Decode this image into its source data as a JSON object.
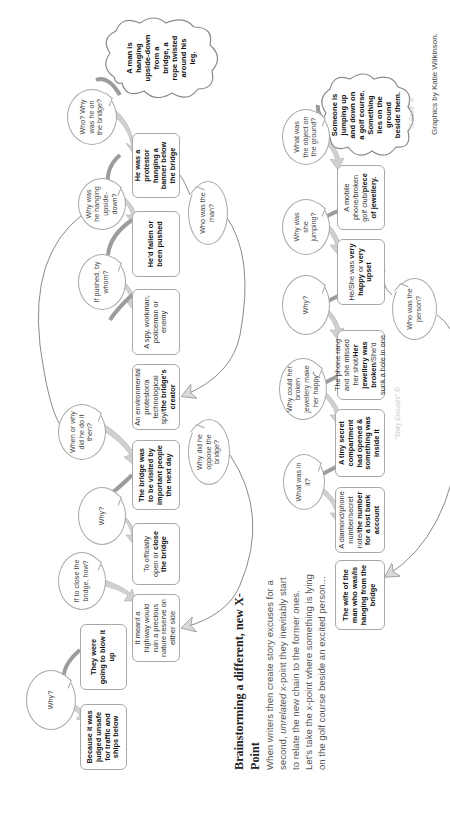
{
  "diagram": {
    "orientation": "rotated-90-ccw",
    "colors": {
      "box_border": "#a8a8a8",
      "arrow_light": "#cfcfcf",
      "arrow_dark": "#9a9a9a",
      "connector_line": "#8a8a8a",
      "text_bold": "#111111",
      "text_regular": "#444444",
      "watermark": "#c8c8c8"
    },
    "chain1": {
      "start_cloud": "A man is hanging upside-down from a bridge, a rope twisted around his leg.",
      "nodes": [
        {
          "id": "n1",
          "bold": "He was a protestor hanging a banner below the bridge",
          "regular": ""
        },
        {
          "id": "n2",
          "bold": "He'd fallen or been pushed",
          "regular": ""
        },
        {
          "id": "n3",
          "bold": "",
          "regular": "A spy, workman, policeman or enemy"
        },
        {
          "id": "n4",
          "regular_pre": "An environmental protestor/a technological spy/",
          "bold": "the bridge's creator"
        },
        {
          "id": "n5",
          "bold": "The bridge was to be visited by important people the next day",
          "regular": ""
        },
        {
          "id": "n6",
          "regular_pre": "To officially open or ",
          "bold": "close the bridge"
        },
        {
          "id": "n7",
          "bold": "",
          "regular": "It meant a highway would ruin a precious nature reserve on either side"
        },
        {
          "id": "n8",
          "bold": "They were going to blow it up",
          "regular": ""
        },
        {
          "id": "n9",
          "bold": "Because it was judged unsafe for traffic and ships below",
          "regular": ""
        }
      ],
      "questions": [
        {
          "id": "q1",
          "text": "Who? Why was he on the bridge?"
        },
        {
          "id": "q2",
          "text": "Why was he hanging upside-down?"
        },
        {
          "id": "q3",
          "text": "If pushed, by whom?"
        },
        {
          "id": "q4",
          "text": "Who was the man?"
        },
        {
          "id": "q5",
          "text": "When or why did he do it then?"
        },
        {
          "id": "q6",
          "text": "Why did he oppose the bridge?"
        },
        {
          "id": "q7",
          "text": "Why?"
        },
        {
          "id": "q8",
          "text": "If to close the bridge, how?"
        },
        {
          "id": "q9",
          "text": "Why?"
        }
      ]
    },
    "section": {
      "title": "Brainstorming a different, new X-Point",
      "paragraph_pre": "When writers then create story excuses for a second, ",
      "paragraph_em": "unrelated",
      "paragraph_post": " x-point they inevitably start to relate the new chain to the former ones. Let's take the x-point where something is lying on the golf course beside an excited person..."
    },
    "chain2": {
      "start_cloud": "Someone is jumping up and down on a golf course. Something lies on the ground beside them.",
      "nodes": [
        {
          "id": "m1",
          "regular_pre": "A mobile phone/broken golf club/",
          "bold": "piece of jewellery."
        },
        {
          "id": "m2",
          "regular_pre": "He/She was ",
          "bold": "very happy",
          "regular_mid": " or ",
          "bold2": "very upset"
        },
        {
          "id": "m3",
          "regular_pre": "The phone rang and she missed her shot/",
          "bold": "Her jewellery was broken",
          "regular_post": "/She'd sunk a hole in one"
        },
        {
          "id": "m4",
          "bold": "A tiny secret compartment had opened & something was inside it",
          "regular": ""
        },
        {
          "id": "m5",
          "regular_pre": "A diamond/phone number/secret note/",
          "bold": "the number for a lost bank account"
        },
        {
          "id": "m6",
          "bold": "The wife of the man who was/is hanging from the bridge",
          "regular": ""
        }
      ],
      "questions": [
        {
          "id": "p1",
          "text": "What was the object on the ground?"
        },
        {
          "id": "p2",
          "text": "Why was she jumping?"
        },
        {
          "id": "p3",
          "text": "Why?"
        },
        {
          "id": "p4",
          "text": "Who was the person?"
        },
        {
          "id": "p5",
          "text": "Why could her broken jewellery make her happy?"
        },
        {
          "id": "p6",
          "text": "What was in it?"
        }
      ]
    },
    "watermarks": {
      "xpoint": "\"X-Point\" ©",
      "story_excuses": "\"Story Excuses\" ©"
    },
    "credit": "Graphics  by Katie Wilkinson."
  }
}
